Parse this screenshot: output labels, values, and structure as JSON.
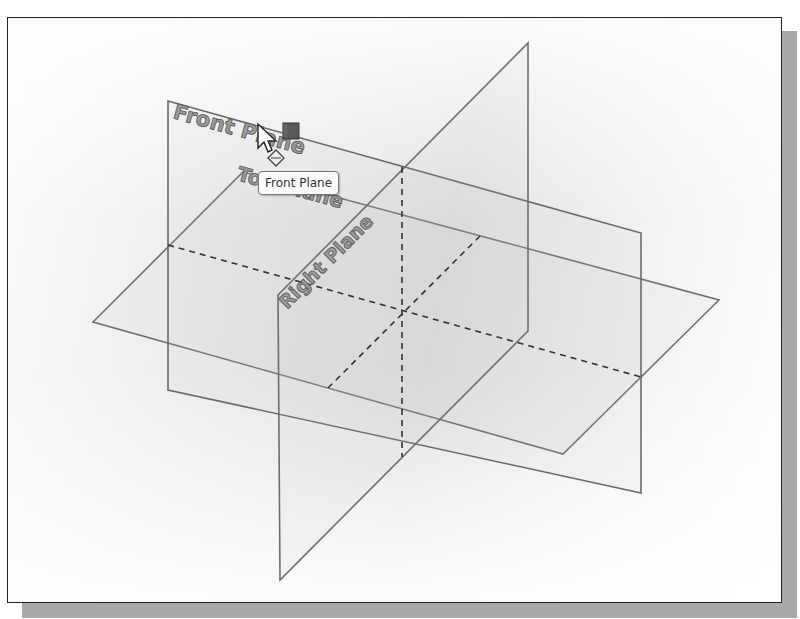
{
  "viewport": {
    "background_colors": [
      "#fbfbfb",
      "#e2e2e2",
      "#fefefe"
    ],
    "border_color": "#222222",
    "shadow_color": "#a9a9a9"
  },
  "planes": {
    "front": {
      "label": "Front Plane"
    },
    "top": {
      "label": "Top Plane"
    },
    "right": {
      "label": "Right Plane"
    }
  },
  "tooltip": {
    "text": "Front Plane"
  },
  "cursor": {
    "icon": "arrow-cursor-icon",
    "badge_icon": "plane-selection-icon"
  },
  "colors": {
    "edge": "#6e6e6e",
    "dashed": "#333333",
    "label_fill": "#9a9a9a",
    "handle": "#5a5a5a"
  }
}
